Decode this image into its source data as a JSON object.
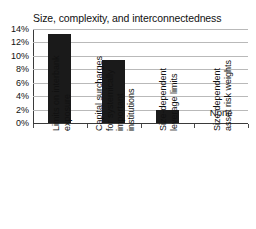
{
  "chart_data": {
    "type": "bar",
    "title": "Size, complexity, and interconnectedness",
    "xlabel": "",
    "ylabel": "",
    "ylim": [
      0,
      14
    ],
    "grid": true,
    "legend": false,
    "categories": [
      "Limits on interbank exposure",
      "Capital surcharges for systemically important institutions",
      "Size-dependent leverage limits",
      "Size-dependent asset risk weights"
    ],
    "category_lines": [
      [
        "Limits on interbank",
        "exposure"
      ],
      [
        "Capital surcharges",
        "for systemically",
        "important",
        "institutions"
      ],
      [
        "Size-dependent",
        "leverage limits"
      ],
      [
        "Size-dependent",
        "asset risk weights"
      ]
    ],
    "values": [
      13.3,
      9.4,
      2.0,
      0
    ],
    "value_labels": [
      "",
      "",
      "",
      "None"
    ],
    "yticks": [
      0,
      2,
      4,
      6,
      8,
      10,
      12,
      14
    ],
    "ytick_labels": [
      "0%",
      "2%",
      "4%",
      "6%",
      "8%",
      "10%",
      "12%",
      "14%"
    ],
    "annotations": [
      {
        "text": "None",
        "category_index": 3,
        "value": 2.0
      }
    ],
    "colors": {
      "bar": "#1a1a1a",
      "grid": "#b9b9b9",
      "axis": "#3a3a3a",
      "text": "#111111",
      "background": "#ffffff"
    }
  }
}
